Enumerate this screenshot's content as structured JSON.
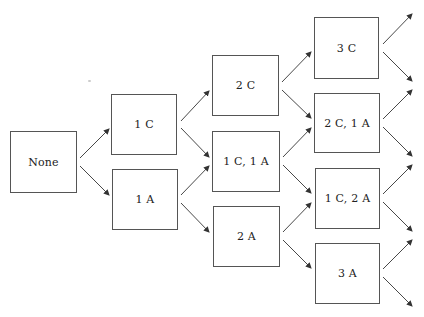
{
  "diagram": {
    "type": "tree",
    "direction": "left-to-right",
    "nodes": [
      {
        "id": "none",
        "label": "None",
        "x": 10,
        "y": 131,
        "w": 67,
        "h": 62
      },
      {
        "id": "1c",
        "label": "1 C",
        "x": 111,
        "y": 94,
        "w": 66,
        "h": 61
      },
      {
        "id": "1a",
        "label": "1 A",
        "x": 112,
        "y": 169,
        "w": 66,
        "h": 61
      },
      {
        "id": "2c",
        "label": "2 C",
        "x": 212,
        "y": 55,
        "w": 67,
        "h": 61
      },
      {
        "id": "1c1a",
        "label": "1 C, 1 A",
        "x": 212,
        "y": 131,
        "w": 68,
        "h": 61
      },
      {
        "id": "2a",
        "label": "2 A",
        "x": 213,
        "y": 206,
        "w": 67,
        "h": 61
      },
      {
        "id": "3c",
        "label": "3 C",
        "x": 314,
        "y": 17,
        "w": 65,
        "h": 62
      },
      {
        "id": "2c1a",
        "label": "2 C, 1 A",
        "x": 314,
        "y": 93,
        "w": 66,
        "h": 60
      },
      {
        "id": "1c2a",
        "label": "1 C, 2 A",
        "x": 315,
        "y": 168,
        "w": 65,
        "h": 61
      },
      {
        "id": "3a",
        "label": "3 A",
        "x": 315,
        "y": 243,
        "w": 65,
        "h": 61
      }
    ],
    "edges": [
      {
        "from": "none",
        "to": "1c",
        "x1": 80,
        "y1": 158,
        "x2": 109,
        "y2": 129
      },
      {
        "from": "none",
        "to": "1a",
        "x1": 80,
        "y1": 166,
        "x2": 109,
        "y2": 195
      },
      {
        "from": "1c",
        "to": "2c",
        "x1": 181,
        "y1": 121,
        "x2": 209,
        "y2": 91
      },
      {
        "from": "1c",
        "to": "1c1a",
        "x1": 181,
        "y1": 128,
        "x2": 209,
        "y2": 157
      },
      {
        "from": "1a",
        "to": "1c1a",
        "x1": 181,
        "y1": 195,
        "x2": 209,
        "y2": 166
      },
      {
        "from": "1a",
        "to": "2a",
        "x1": 181,
        "y1": 203,
        "x2": 209,
        "y2": 232
      },
      {
        "from": "2c",
        "to": "3c",
        "x1": 282,
        "y1": 82,
        "x2": 311,
        "y2": 52
      },
      {
        "from": "2c",
        "to": "2c1a",
        "x1": 282,
        "y1": 90,
        "x2": 311,
        "y2": 118
      },
      {
        "from": "1c1a",
        "to": "2c1a",
        "x1": 283,
        "y1": 157,
        "x2": 311,
        "y2": 128
      },
      {
        "from": "1c1a",
        "to": "1c2a",
        "x1": 283,
        "y1": 165,
        "x2": 311,
        "y2": 193
      },
      {
        "from": "2a",
        "to": "1c2a",
        "x1": 283,
        "y1": 232,
        "x2": 311,
        "y2": 203
      },
      {
        "from": "2a",
        "to": "3a",
        "x1": 283,
        "y1": 240,
        "x2": 311,
        "y2": 268
      },
      {
        "from": "3c",
        "to": "out1",
        "x1": 383,
        "y1": 44,
        "x2": 412,
        "y2": 14
      },
      {
        "from": "3c",
        "to": "out2",
        "x1": 383,
        "y1": 52,
        "x2": 412,
        "y2": 81
      },
      {
        "from": "2c1a",
        "to": "out2",
        "x1": 383,
        "y1": 119,
        "x2": 412,
        "y2": 90
      },
      {
        "from": "2c1a",
        "to": "out3",
        "x1": 383,
        "y1": 127,
        "x2": 412,
        "y2": 156
      },
      {
        "from": "1c2a",
        "to": "out3",
        "x1": 383,
        "y1": 194,
        "x2": 412,
        "y2": 165
      },
      {
        "from": "1c2a",
        "to": "out4",
        "x1": 383,
        "y1": 202,
        "x2": 412,
        "y2": 231
      },
      {
        "from": "3a",
        "to": "out4",
        "x1": 383,
        "y1": 269,
        "x2": 412,
        "y2": 240
      },
      {
        "from": "3a",
        "to": "out5",
        "x1": 383,
        "y1": 277,
        "x2": 412,
        "y2": 306
      }
    ],
    "colors": {
      "line": "#333333",
      "border": "#555555",
      "text": "#222222"
    }
  }
}
